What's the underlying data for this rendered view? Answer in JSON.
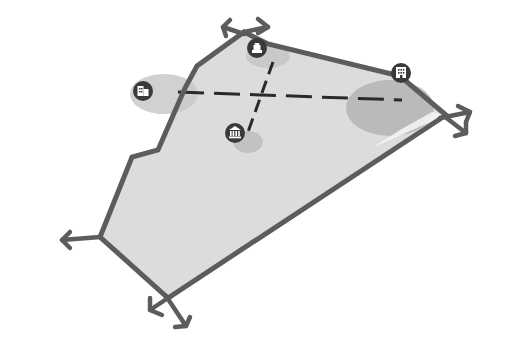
{
  "diagram": {
    "title": "",
    "colors": {
      "background": "#ffffff",
      "area_fill": "#dcdcdc",
      "outline": "#5c5c5c",
      "zone_fill": "#c4c4c4",
      "zone_dark": "#b4b4b4",
      "dash": "#2a2a2a",
      "icon_bg": "#3a3a3a",
      "icon_fg": "#ffffff"
    },
    "polygon": {
      "points": "244,32 268,44 400,76 446,115 168,298 100,237 132,157 158,150 185,88 197,66"
    },
    "arrows": [
      {
        "name": "arrow-top-left",
        "x1": 244,
        "y1": 32,
        "x2": 224,
        "y2": 26
      },
      {
        "name": "arrow-top-right",
        "x1": 244,
        "y1": 32,
        "x2": 268,
        "y2": 26
      },
      {
        "name": "arrow-right-upper",
        "x1": 446,
        "y1": 115,
        "x2": 470,
        "y2": 112
      },
      {
        "name": "arrow-right-lower",
        "x1": 446,
        "y1": 115,
        "x2": 464,
        "y2": 134
      },
      {
        "name": "arrow-left",
        "x1": 100,
        "y1": 237,
        "x2": 62,
        "y2": 240
      },
      {
        "name": "arrow-bottom-left",
        "x1": 168,
        "y1": 298,
        "x2": 150,
        "y2": 308
      },
      {
        "name": "arrow-bottom-right",
        "x1": 168,
        "y1": 298,
        "x2": 186,
        "y2": 326
      }
    ],
    "zones": [
      {
        "name": "zone-west",
        "cx": 164,
        "cy": 94,
        "rx": 34,
        "ry": 20
      },
      {
        "name": "zone-east",
        "cx": 390,
        "cy": 108,
        "rx": 44,
        "ry": 28
      },
      {
        "name": "zone-north",
        "cx": 266,
        "cy": 56,
        "rx": 22,
        "ry": 12
      },
      {
        "name": "zone-south",
        "cx": 246,
        "cy": 142,
        "rx": 16,
        "ry": 12
      }
    ],
    "axes": {
      "horizontal": {
        "x1": 178,
        "y1": 92,
        "x2": 402,
        "y2": 100
      },
      "vertical": {
        "x1": 272,
        "y1": 62,
        "x2": 248,
        "y2": 130
      }
    },
    "markers": [
      {
        "name": "lighthouse-marker",
        "icon": "lighthouse-icon",
        "cx": 257,
        "cy": 48
      },
      {
        "name": "building-west-marker",
        "icon": "building-icon",
        "cx": 143,
        "cy": 91
      },
      {
        "name": "building-east-marker",
        "icon": "office-building-icon",
        "cx": 401,
        "cy": 73
      },
      {
        "name": "museum-marker",
        "icon": "museum-icon",
        "cx": 235,
        "cy": 133
      }
    ]
  }
}
